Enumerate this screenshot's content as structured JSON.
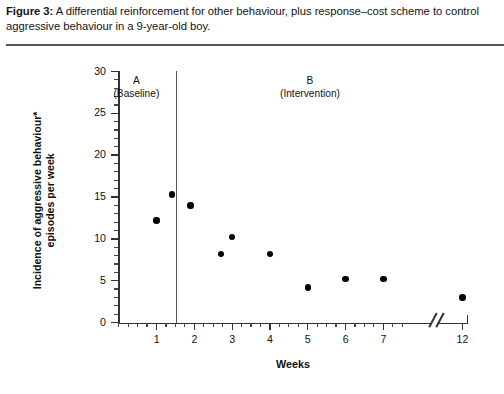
{
  "caption": {
    "figure_label": "Figure 3:",
    "text": " A differential reinforcement for other behaviour, plus response–cost scheme to control aggressive behaviour in a 9-year-old boy."
  },
  "chart_data": {
    "type": "scatter",
    "title": "",
    "xlabel": "Weeks",
    "ylabel": "Incidence of aggressive behaviour*",
    "ylabel_line2": "episodes per week",
    "xlim": [
      0,
      12
    ],
    "ylim": [
      0,
      30
    ],
    "y_ticks": [
      0,
      5,
      10,
      15,
      20,
      25,
      30
    ],
    "y_tick_labels": [
      "0",
      "5",
      "10",
      "15",
      "20",
      "25",
      "30"
    ],
    "y_minor_step": 1,
    "x_ticks": [
      1,
      2,
      3,
      4,
      5,
      6,
      7,
      12
    ],
    "x_tick_labels": [
      "1",
      "2",
      "3",
      "4",
      "5",
      "6",
      "7",
      "12"
    ],
    "x_minor_step": 0.25,
    "grid": false,
    "legend": false,
    "axis_break": {
      "present": true,
      "symbol": "//",
      "after_week": 7.6,
      "before_label": "12"
    },
    "phases": [
      {
        "id": "A",
        "label": "A",
        "sublabel": "(Baseline)",
        "x_start": 0,
        "x_end": 1.5
      },
      {
        "id": "B",
        "label": "B",
        "sublabel": "(Intervention)",
        "x_start": 1.5,
        "x_end": 12
      }
    ],
    "phase_divider_x": 1.5,
    "series": [
      {
        "name": "Incidence of aggressive behaviour episodes per week",
        "points": [
          {
            "x": 1.0,
            "y": 12.2,
            "phase": "A"
          },
          {
            "x": 1.4,
            "y": 15.3,
            "phase": "A"
          },
          {
            "x": 1.9,
            "y": 14.0,
            "phase": "B"
          },
          {
            "x": 2.7,
            "y": 8.2,
            "phase": "B"
          },
          {
            "x": 3.0,
            "y": 10.2,
            "phase": "B"
          },
          {
            "x": 4.0,
            "y": 8.2,
            "phase": "B"
          },
          {
            "x": 5.0,
            "y": 4.2,
            "phase": "B"
          },
          {
            "x": 6.0,
            "y": 5.2,
            "phase": "B"
          },
          {
            "x": 7.0,
            "y": 5.2,
            "phase": "B"
          },
          {
            "x": 12.0,
            "y": 3.0,
            "phase": "B"
          }
        ]
      }
    ]
  }
}
